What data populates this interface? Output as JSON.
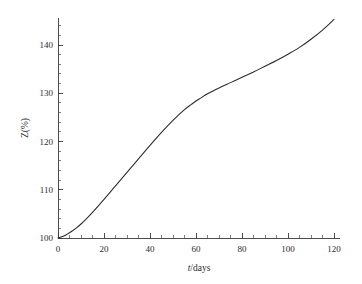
{
  "figure": {
    "background_color": "#ffffff",
    "line_color": "#2a2a2a",
    "axis_color": "#3a3a3a",
    "width": 362,
    "height": 284
  },
  "axes": {
    "x": {
      "label_plain": "t/days",
      "label_italic_part": "t",
      "label_rest": "/days",
      "tick_labels": [
        "0",
        "20",
        "40",
        "60",
        "80",
        "100",
        "120"
      ],
      "tick_values": [
        0,
        20,
        40,
        60,
        80,
        100,
        120
      ],
      "minor_tick_step": 5,
      "range": [
        0,
        122
      ]
    },
    "y": {
      "label_plain": "Z(%)",
      "tick_labels": [
        "100",
        "110",
        "120",
        "130",
        "140"
      ],
      "tick_values": [
        100,
        110,
        120,
        130,
        140
      ],
      "minor_tick_step": 2,
      "range": [
        100,
        147
      ]
    }
  },
  "chart_data": {
    "type": "line",
    "title": "",
    "subtitle": "",
    "xlabel": "t/days",
    "ylabel": "Z(%)",
    "xlim": [
      0,
      122
    ],
    "ylim": [
      100,
      147
    ],
    "grid": false,
    "legend": null,
    "annotations": [],
    "x": [
      0,
      2,
      4,
      6,
      8,
      10,
      12,
      15,
      20,
      25,
      30,
      35,
      40,
      45,
      50,
      55,
      58,
      60,
      62,
      65,
      70,
      75,
      80,
      85,
      90,
      95,
      100,
      105,
      110,
      115,
      120
    ],
    "series": [
      {
        "name": "Z",
        "values": [
          100.0,
          100.3,
          100.8,
          101.4,
          102.1,
          102.9,
          103.8,
          105.3,
          108.0,
          110.8,
          113.6,
          116.4,
          119.2,
          121.9,
          124.4,
          126.6,
          127.7,
          128.4,
          129.0,
          129.9,
          131.1,
          132.2,
          133.3,
          134.4,
          135.6,
          136.8,
          138.1,
          139.5,
          141.2,
          143.1,
          145.3
        ]
      }
    ]
  }
}
